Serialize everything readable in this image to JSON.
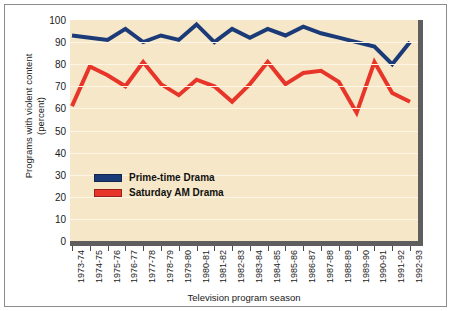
{
  "chart_data": {
    "type": "line",
    "title": "",
    "xlabel": "Television program season",
    "ylabel": "Programs with violent content\n(percent)",
    "ylim": [
      0,
      100
    ],
    "ytick_values": [
      0,
      10,
      20,
      30,
      40,
      50,
      60,
      70,
      80,
      90,
      100
    ],
    "grid": true,
    "legend_position": "inside-left",
    "categories": [
      "1973-74",
      "1974-75",
      "1975-76",
      "1976-77",
      "1977-78",
      "1978-79",
      "1979-80",
      "1980-81",
      "1981-82",
      "1982-83",
      "1983-84",
      "1984-85",
      "1985-86",
      "1986-87",
      "1987-88",
      "1988-89",
      "1989-90",
      "1990-91",
      "1991-92",
      "1992-93"
    ],
    "series": [
      {
        "name": "Prime-time Drama",
        "color": "#1b3a78",
        "values": [
          93,
          92,
          91,
          96,
          90,
          93,
          91,
          98,
          90,
          96,
          92,
          96,
          93,
          97,
          94,
          92,
          90,
          88,
          80,
          90
        ]
      },
      {
        "name": "Saturday AM Drama",
        "color": "#e8352a",
        "values": [
          61,
          79,
          75,
          70,
          81,
          71,
          66,
          73,
          70,
          63,
          71,
          81,
          71,
          76,
          77,
          72,
          58,
          81,
          67,
          63
        ]
      }
    ]
  },
  "axis": {
    "ylabel_text": "Programs with violent content\n(percent)",
    "xlabel_text": "Television program season"
  },
  "legend": {
    "items": [
      {
        "label": "Prime-time Drama",
        "color": "#1b3a78"
      },
      {
        "label": "Saturday AM Drama",
        "color": "#e8352a"
      }
    ]
  },
  "colors": {
    "plot_background": "#f6e7c8",
    "gridline": "#fdf6e6",
    "axis_bar": "#5e5e5e",
    "frame": "#8c8c8c",
    "page_background": "#ffffff",
    "prime_time": "#1b3a78",
    "saturday_am": "#e8352a"
  }
}
